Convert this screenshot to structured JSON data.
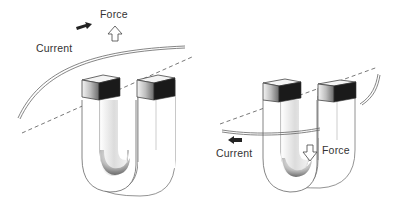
{
  "diagram": {
    "panels": [
      {
        "id": "left",
        "force_label": "Force",
        "current_label": "Current",
        "force_direction": "up",
        "current_direction": "right"
      },
      {
        "id": "right",
        "force_label": "Force",
        "current_label": "Current",
        "force_direction": "down",
        "current_direction": "left"
      }
    ],
    "colors": {
      "line": "#555555",
      "shade_dark": "#1a1a1a",
      "shade_mid": "#9a9a9a",
      "background": "#ffffff"
    }
  }
}
